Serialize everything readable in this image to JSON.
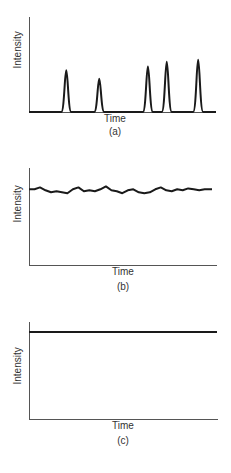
{
  "chart_data": [
    {
      "type": "line",
      "panel": "(a)",
      "title": "",
      "xlabel": "Time",
      "ylabel": "Intensity",
      "caption": "(a)",
      "description": "Baseline with five sharp narrow peaks",
      "peaks": [
        {
          "x": 0.11,
          "height": 0.44
        },
        {
          "x": 0.32,
          "height": 0.35
        },
        {
          "x": 0.63,
          "height": 0.48
        },
        {
          "x": 0.75,
          "height": 0.53
        },
        {
          "x": 0.95,
          "height": 0.55
        }
      ],
      "grid": false,
      "ticks": false
    },
    {
      "type": "line",
      "panel": "(b)",
      "title": "",
      "xlabel": "Time",
      "ylabel": "Intensity",
      "caption": "(b)",
      "description": "Noisy, roughly constant signal near 77% of axis height",
      "x": [
        0,
        0.03,
        0.06,
        0.09,
        0.12,
        0.15,
        0.18,
        0.21,
        0.24,
        0.27,
        0.3,
        0.33,
        0.36,
        0.39,
        0.42,
        0.45,
        0.48,
        0.51,
        0.54,
        0.57,
        0.6,
        0.63,
        0.66,
        0.69,
        0.72,
        0.75,
        0.78,
        0.81,
        0.84,
        0.87,
        0.9,
        0.93,
        0.96,
        1.0
      ],
      "values": [
        0.78,
        0.78,
        0.8,
        0.77,
        0.75,
        0.76,
        0.75,
        0.74,
        0.78,
        0.8,
        0.76,
        0.77,
        0.76,
        0.78,
        0.81,
        0.77,
        0.76,
        0.74,
        0.77,
        0.78,
        0.75,
        0.74,
        0.75,
        0.78,
        0.8,
        0.77,
        0.76,
        0.78,
        0.77,
        0.79,
        0.78,
        0.77,
        0.78,
        0.78
      ],
      "ylim": [
        0,
        1
      ],
      "grid": false,
      "ticks": false
    },
    {
      "type": "line",
      "panel": "(c)",
      "title": "",
      "xlabel": "Time",
      "ylabel": "Intensity",
      "caption": "(c)",
      "description": "Constant flat line near top of axis",
      "x": [
        0,
        1
      ],
      "values": [
        0.9,
        0.9
      ],
      "ylim": [
        0,
        1
      ],
      "grid": false,
      "ticks": false
    }
  ],
  "labels": {
    "a": {
      "xlabel": "Time",
      "ylabel": "Intensity",
      "caption": "(a)"
    },
    "b": {
      "xlabel": "Time",
      "ylabel": "Intensity",
      "caption": "(b)"
    },
    "c": {
      "xlabel": "Time",
      "ylabel": "Intensity",
      "caption": "(c)"
    }
  },
  "colors": {
    "line": "#1a1a1a",
    "axis": "#555555"
  }
}
